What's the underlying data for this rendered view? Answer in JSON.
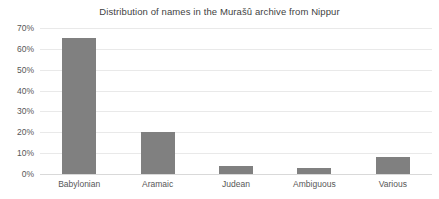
{
  "chart_data": {
    "type": "bar",
    "title": "Distribution of names in the Murašû archive from Nippur",
    "xlabel": "",
    "ylabel": "",
    "categories": [
      "Babylonian",
      "Aramaic",
      "Judean",
      "Ambiguous",
      "Various"
    ],
    "values": [
      65,
      20,
      4,
      3,
      8
    ],
    "value_format": "percent",
    "ylim": [
      0,
      70
    ],
    "ytick_step": 10,
    "ytick_labels": [
      "0%",
      "10%",
      "20%",
      "30%",
      "40%",
      "50%",
      "60%",
      "70%"
    ],
    "ytick_values": [
      0,
      10,
      20,
      30,
      40,
      50,
      60,
      70
    ],
    "grid": true,
    "grid_axis": "y",
    "legend": false,
    "legend_position": "none",
    "series": [
      {
        "name": "Share of names",
        "values": [
          65,
          20,
          4,
          3,
          8
        ]
      }
    ],
    "colors": {
      "bar_fill": "#808080",
      "gridline": "#e9e9e9",
      "baseline": "#d9d9d9",
      "background": "#ffffff",
      "title_text": "#3f3f3f",
      "tick_text": "#575757"
    }
  }
}
